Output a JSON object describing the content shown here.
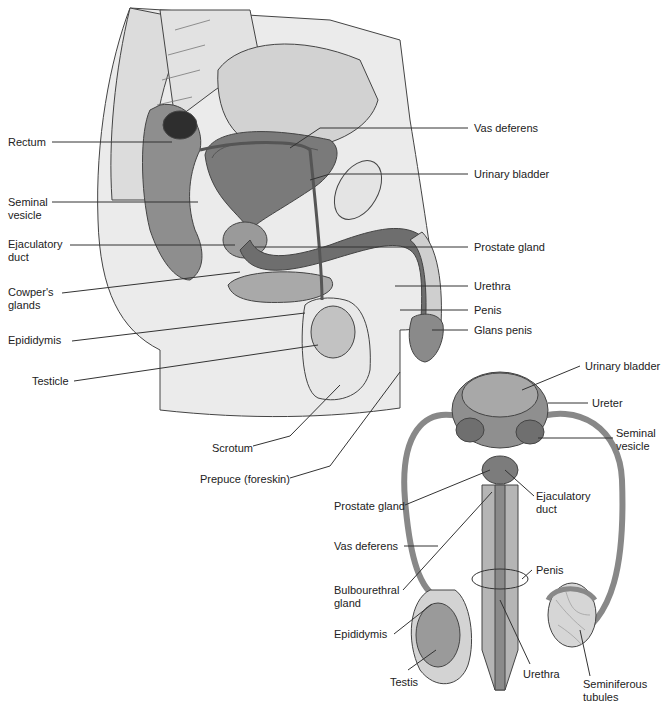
{
  "sagittal_view": {
    "labels_left": [
      {
        "text": "Rectum",
        "x": 8,
        "y": 136
      },
      {
        "text": "Seminal\nvesicle",
        "x": 8,
        "y": 196
      },
      {
        "text": "Ejaculatory\nduct",
        "x": 8,
        "y": 238
      },
      {
        "text": "Cowper's\nglands",
        "x": 8,
        "y": 288
      },
      {
        "text": "Epididymis",
        "x": 8,
        "y": 334
      },
      {
        "text": "Testicle",
        "x": 32,
        "y": 375
      }
    ],
    "labels_right": [
      {
        "text": "Vas deferens",
        "x": 474,
        "y": 122
      },
      {
        "text": "Urinary bladder",
        "x": 474,
        "y": 168
      },
      {
        "text": "Prostate gland",
        "x": 474,
        "y": 241
      },
      {
        "text": "Urethra",
        "x": 474,
        "y": 280
      },
      {
        "text": "Penis",
        "x": 474,
        "y": 305
      },
      {
        "text": "Glans penis",
        "x": 474,
        "y": 325
      }
    ],
    "labels_bottom": [
      {
        "text": "Scrotum",
        "x": 212,
        "y": 442
      },
      {
        "text": "Prepuce (foreskin)",
        "x": 200,
        "y": 474
      }
    ]
  },
  "frontal_view": {
    "labels": [
      {
        "text": "Urinary bladder",
        "x": 585,
        "y": 360
      },
      {
        "text": "Ureter",
        "x": 592,
        "y": 397
      },
      {
        "text": "Seminal\nvesicle",
        "x": 616,
        "y": 427
      },
      {
        "text": "Prostate gland",
        "x": 334,
        "y": 500
      },
      {
        "text": "Ejaculatory\nduct",
        "x": 536,
        "y": 490
      },
      {
        "text": "Vas deferens",
        "x": 334,
        "y": 540
      },
      {
        "text": "Penis",
        "x": 536,
        "y": 564
      },
      {
        "text": "Bulbourethral\ngland",
        "x": 334,
        "y": 584
      },
      {
        "text": "Epididymis",
        "x": 334,
        "y": 628
      },
      {
        "text": "Testis",
        "x": 390,
        "y": 676
      },
      {
        "text": "Urethra",
        "x": 523,
        "y": 668
      },
      {
        "text": "Seminiferous\ntubules",
        "x": 583,
        "y": 678
      }
    ]
  },
  "colors": {
    "leader_line": "#333333",
    "tissue_light": "#d9d9d9",
    "tissue_mid": "#9a9a9a",
    "tissue_dark": "#555555",
    "outline": "#444444",
    "skin": "#e6e6e6"
  }
}
